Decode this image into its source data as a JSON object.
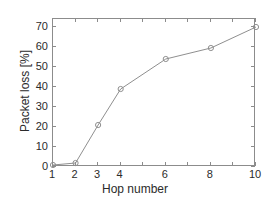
{
  "chart_data": {
    "type": "line",
    "title": "",
    "xlabel": "Hop number",
    "ylabel": "Packet loss [%]",
    "x": [
      1,
      2,
      3,
      4,
      6,
      8,
      10
    ],
    "values": [
      1,
      2,
      21,
      39,
      54,
      59.5,
      70
    ],
    "series": [
      {
        "name": "Packet loss",
        "x": [
          1,
          2,
          3,
          4,
          6,
          8,
          10
        ],
        "values": [
          1,
          2,
          21,
          39,
          54,
          59.5,
          70
        ]
      }
    ],
    "xlim": [
      1,
      10
    ],
    "ylim": [
      0,
      74
    ],
    "xticks": [
      1,
      2,
      3,
      4,
      6,
      8,
      10
    ],
    "xticklabels": [
      "1",
      "2",
      "3",
      "4",
      "6",
      "8",
      "10"
    ],
    "yticks": [
      0,
      10,
      20,
      30,
      40,
      50,
      60,
      70
    ],
    "yticklabels": [
      "0",
      "10",
      "20",
      "30",
      "40",
      "50",
      "60",
      "70"
    ],
    "grid": false,
    "legend": null,
    "marker": "circle",
    "line_color": "#8f8f8f",
    "marker_color": "#8f8f8f",
    "axis_color": "#8c8c8c",
    "background_color": "#ffffff",
    "text_color": "#2b2b2b"
  }
}
